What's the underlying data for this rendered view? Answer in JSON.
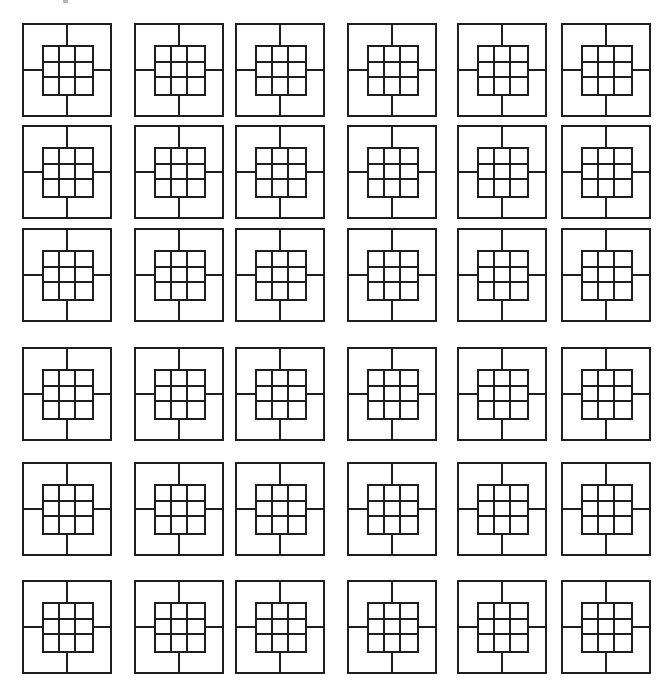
{
  "canvas": {
    "width": 669,
    "height": 694,
    "background": "#ffffff"
  },
  "stroke_color": "#1e1e1e",
  "pattern": {
    "name": "square-tile-with-3x3-grid",
    "inner_grid": {
      "rows": 3,
      "cols": 3
    },
    "connectors": [
      "top",
      "bottom",
      "left",
      "right"
    ]
  },
  "layout": {
    "rows": 6,
    "cols": 6,
    "tile_width": 90,
    "tile_height": 94,
    "col_x": [
      22,
      134,
      235,
      347,
      457,
      561
    ],
    "row_y": [
      23,
      125,
      228,
      347,
      462,
      580
    ]
  }
}
